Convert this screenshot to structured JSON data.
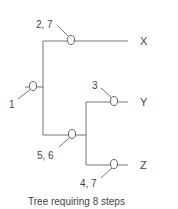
{
  "diagram": {
    "type": "phylogenetic-tree",
    "caption": "Tree requiring 8 steps",
    "taxa": [
      {
        "id": "x",
        "label": "X"
      },
      {
        "id": "y",
        "label": "Y"
      },
      {
        "id": "z",
        "label": "Z"
      }
    ],
    "character_changes": [
      {
        "id": "root",
        "branch": "root",
        "label": "1"
      },
      {
        "id": "x-branch",
        "branch": "X",
        "label": "2, 7"
      },
      {
        "id": "yz-branch",
        "branch": "YZ ancestor",
        "label": "5, 6"
      },
      {
        "id": "y-branch",
        "branch": "Y",
        "label": "3"
      },
      {
        "id": "z-branch",
        "branch": "Z",
        "label": "4, 7"
      }
    ],
    "colors": {
      "line": "#777777",
      "text": "#444444",
      "background": "#ffffff"
    }
  }
}
